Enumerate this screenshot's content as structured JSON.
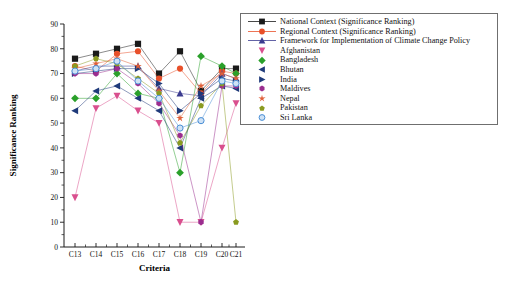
{
  "chart_data": {
    "type": "line",
    "title": "",
    "xlabel": "Criteria",
    "ylabel": "Significance Ranking",
    "categories": [
      "C13",
      "C14",
      "C15",
      "C16",
      "C17",
      "C18",
      "C19",
      "C20",
      "C21"
    ],
    "ylim": [
      0,
      90
    ],
    "ytick_step": 10,
    "yticks": [
      0,
      10,
      20,
      30,
      40,
      50,
      60,
      70,
      80,
      90
    ],
    "grid": false,
    "legend_position": "right-outside",
    "series": [
      {
        "name": "National Context (Significance Ranking)",
        "color": "#1a1a1a",
        "marker": "square",
        "values": [
          76,
          78,
          80,
          82,
          70,
          79,
          63,
          72,
          72
        ]
      },
      {
        "name": "Regional Context (Significance Ranking)",
        "color": "#e8502a",
        "marker": "circle",
        "values": [
          73,
          71,
          78,
          79,
          68,
          72,
          62,
          71,
          70
        ]
      },
      {
        "name": "Framework for Implementation of Climate Change Policy",
        "color": "#3b3b8f",
        "marker": "triangle-up",
        "values": [
          71,
          73,
          73,
          73,
          64,
          62,
          61,
          70,
          68
        ]
      },
      {
        "name": "Afghanistan",
        "color": "#d94f8e",
        "marker": "triangle-down",
        "values": [
          20,
          56,
          61,
          55,
          50,
          10,
          10,
          40,
          58
        ]
      },
      {
        "name": "Bangladesh",
        "color": "#2aa02a",
        "marker": "diamond",
        "values": [
          60,
          60,
          70,
          62,
          60,
          30,
          77,
          73,
          70
        ]
      },
      {
        "name": "Bhutan",
        "color": "#1f3a7a",
        "marker": "triangle-left",
        "values": [
          55,
          63,
          65,
          60,
          55,
          40,
          60,
          65,
          64
        ]
      },
      {
        "name": "India",
        "color": "#1f3a7a",
        "marker": "triangle-right",
        "values": [
          70,
          71,
          72,
          72,
          66,
          55,
          62,
          68,
          67
        ]
      },
      {
        "name": "Maldives",
        "color": "#9b2d8f",
        "marker": "hexagon",
        "values": [
          70,
          70,
          72,
          66,
          58,
          45,
          10,
          65,
          65
        ]
      },
      {
        "name": "Nepal",
        "color": "#e0603a",
        "marker": "star",
        "values": [
          72,
          74,
          76,
          73,
          63,
          52,
          65,
          70,
          68
        ]
      },
      {
        "name": "Pakistan",
        "color": "#8a9b20",
        "marker": "pentagon",
        "values": [
          73,
          76,
          74,
          68,
          62,
          42,
          57,
          66,
          10
        ]
      },
      {
        "name": "Sri Lanka",
        "color": "#4a8fd6",
        "marker": "circle-open",
        "values": [
          71,
          72,
          75,
          67,
          60,
          48,
          51,
          67,
          66
        ]
      }
    ]
  }
}
